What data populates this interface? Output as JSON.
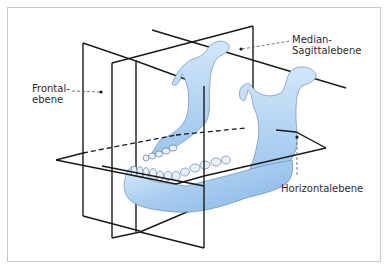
{
  "figure": {
    "colors": {
      "bone_light": "#d6e8f8",
      "bone_mid": "#a9cdf0",
      "bone_dark": "#7fb0e3",
      "line": "#1a1a1a",
      "frame_border": "#c9c9c9",
      "label_text": "#2b2b2b"
    }
  },
  "labels": {
    "frontal": "Frontal-\nebene",
    "median_sagittal": "Median-\nSagittalebene",
    "horizontal": "Horizontalebene"
  },
  "planes": [
    {
      "id": "frontal",
      "name": "Frontalebene"
    },
    {
      "id": "median_sagittal",
      "name": "Median-Sagittalebene"
    },
    {
      "id": "horizontal",
      "name": "Horizontalebene"
    }
  ]
}
